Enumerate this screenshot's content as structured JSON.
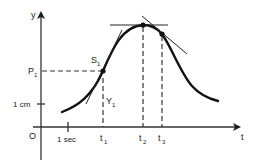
{
  "diagram": {
    "axes": {
      "y_label": "y",
      "x_label": "t",
      "origin_label": "O"
    },
    "ticks": {
      "x_unit": "1 sec",
      "y_unit": "1 cm"
    },
    "points": {
      "s1_label": "S",
      "s1_sub": "1",
      "p1_label": "P",
      "p1_sub": "1",
      "y1_label": "Y",
      "y1_sub": "1"
    },
    "time_marks": [
      {
        "label": "t",
        "sub": "1"
      },
      {
        "label": "t",
        "sub": "2"
      },
      {
        "label": "t",
        "sub": "3"
      }
    ],
    "colors": {
      "ink": "#1a1a1a",
      "background": "#ffffff"
    }
  }
}
